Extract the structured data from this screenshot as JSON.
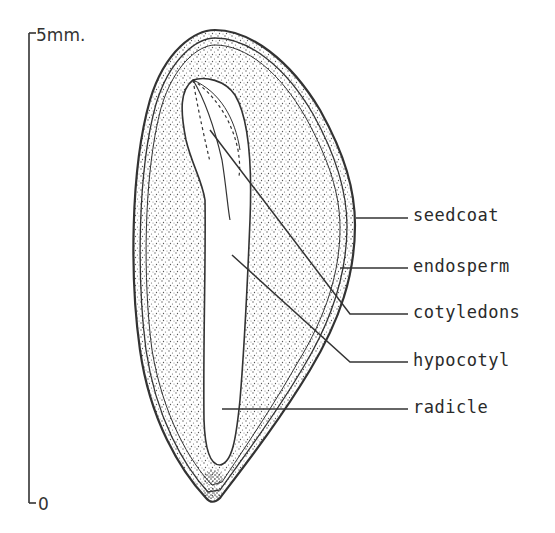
{
  "figure": {
    "scale_bar": {
      "top_label": "5mm.",
      "bottom_label": "0"
    },
    "labels": [
      {
        "id": "seedcoat",
        "text": "seedcoat"
      },
      {
        "id": "endosperm",
        "text": "endosperm"
      },
      {
        "id": "cotyledons",
        "text": "cotyledons"
      },
      {
        "id": "hypocotyl",
        "text": "hypocotyl"
      },
      {
        "id": "radicle",
        "text": "radicle"
      }
    ],
    "colors": {
      "ink": "#333333",
      "background": "#ffffff",
      "stipple": "#555555"
    }
  }
}
